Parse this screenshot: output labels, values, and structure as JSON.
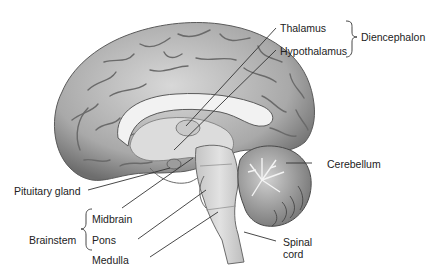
{
  "diagram": {
    "type": "anatomical-illustration",
    "labels": {
      "thalamus": "Thalamus",
      "hypothalamus": "Hypothalamus",
      "diencephalon": "Diencephalon",
      "cerebellum": "Cerebellum",
      "pituitary_gland": "Pituitary gland",
      "midbrain": "Midbrain",
      "pons": "Pons",
      "medulla": "Medulla",
      "brainstem": "Brainstem",
      "spinal_cord_line1": "Spinal",
      "spinal_cord_line2": "cord"
    },
    "groups": [
      {
        "name": "Diencephalon",
        "members": [
          "Thalamus",
          "Hypothalamus"
        ]
      },
      {
        "name": "Brainstem",
        "members": [
          "Midbrain",
          "Pons",
          "Medulla"
        ]
      }
    ],
    "colors": {
      "background": "#ffffff",
      "cortex": "#b8b8b8",
      "cortex_dark": "#6e6e6e",
      "white_matter": "#e6e6e6",
      "brainstem": "#d6d6d6",
      "cerebellum": "#a0a0a0",
      "leader_line": "#333333",
      "text": "#222222"
    }
  }
}
